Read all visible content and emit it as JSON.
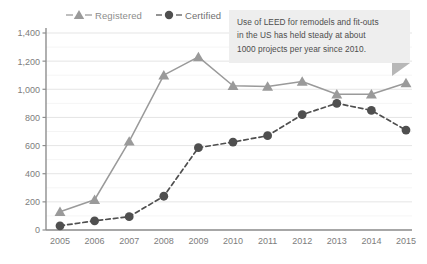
{
  "chart_data": {
    "type": "line",
    "title": "",
    "xlabel": "",
    "ylabel": "",
    "categories": [
      "2005",
      "2006",
      "2007",
      "2008",
      "2009",
      "2010",
      "2011",
      "2012",
      "2013",
      "2014",
      "2015"
    ],
    "series": [
      {
        "name": "Registered",
        "marker": "triangle",
        "line_style": "solid",
        "color": "#9a9a9a",
        "values": [
          130,
          215,
          630,
          1100,
          1230,
          1025,
          1020,
          1055,
          965,
          965,
          1045
        ]
      },
      {
        "name": "Certified",
        "marker": "circle",
        "line_style": "dashed",
        "color": "#4f4f4f",
        "values": [
          30,
          65,
          95,
          240,
          585,
          625,
          670,
          820,
          900,
          850,
          710
        ]
      }
    ],
    "ylim": [
      0,
      1400
    ],
    "ytick_step": 200,
    "yticks": [
      "0",
      "200",
      "400",
      "600",
      "800",
      "1,000",
      "1,200",
      "1,400"
    ],
    "grid": true,
    "grid_minor_step": 100,
    "legend_position": "top-left"
  },
  "legend": {
    "entries": [
      {
        "label": "Registered",
        "icon": "triangle-marker-icon"
      },
      {
        "label": "Certified",
        "icon": "circle-marker-icon"
      }
    ]
  },
  "callout": {
    "lines": [
      "Use of LEED for remodels and fit-outs",
      "in the US has held steady at about",
      "1000 projects per year since 2010."
    ]
  }
}
